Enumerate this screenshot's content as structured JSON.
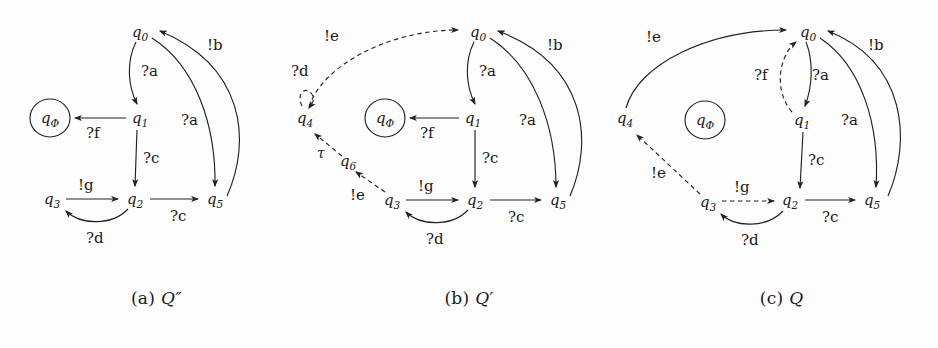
{
  "figure": {
    "background_color": "#fdfdfd",
    "stroke_color": "#222222",
    "text_color": "#1a1a1a"
  },
  "panels": [
    {
      "id": "a",
      "caption_index": "(a)",
      "caption_symbol": "Q″",
      "nodes": [
        {
          "name": "q0",
          "base": "q",
          "sub": "0",
          "x": 140,
          "y": 32,
          "accepting": false
        },
        {
          "name": "q1",
          "base": "q",
          "sub": "1",
          "x": 140,
          "y": 118,
          "accepting": false
        },
        {
          "name": "qPhi",
          "base": "q",
          "sub": "Φ",
          "x": 50,
          "y": 118,
          "accepting": true
        },
        {
          "name": "q2",
          "base": "q",
          "sub": "2",
          "x": 135,
          "y": 199,
          "accepting": false
        },
        {
          "name": "q3",
          "base": "q",
          "sub": "3",
          "x": 52,
          "y": 199,
          "accepting": false
        },
        {
          "name": "q5",
          "base": "q",
          "sub": "5",
          "x": 215,
          "y": 199,
          "accepting": false
        }
      ],
      "edges": [
        {
          "from": "q0",
          "to": "q1",
          "label": "?a",
          "style": "solid"
        },
        {
          "from": "q1",
          "to": "qPhi",
          "label": "?f",
          "style": "solid"
        },
        {
          "from": "q1",
          "to": "q2",
          "label": "?c",
          "style": "solid"
        },
        {
          "from": "q3",
          "to": "q2",
          "label": "!g",
          "style": "solid"
        },
        {
          "from": "q2",
          "to": "q3",
          "label": "?d",
          "style": "solid"
        },
        {
          "from": "q2",
          "to": "q5",
          "label": "?c",
          "style": "solid"
        },
        {
          "from": "q0",
          "to": "q5",
          "label": "?a",
          "style": "solid"
        },
        {
          "from": "q5",
          "to": "q0",
          "label": "!b",
          "style": "solid"
        }
      ]
    },
    {
      "id": "b",
      "caption_index": "(b)",
      "caption_symbol": "Q′",
      "nodes": [
        {
          "name": "q0",
          "base": "q",
          "sub": "0",
          "x": 478,
          "y": 32,
          "accepting": false
        },
        {
          "name": "q1",
          "base": "q",
          "sub": "1",
          "x": 473,
          "y": 118,
          "accepting": false
        },
        {
          "name": "qPhi",
          "base": "q",
          "sub": "Φ",
          "x": 385,
          "y": 118,
          "accepting": true
        },
        {
          "name": "q4",
          "base": "q",
          "sub": "4",
          "x": 305,
          "y": 118,
          "accepting": false
        },
        {
          "name": "q6",
          "base": "q",
          "sub": "6",
          "x": 348,
          "y": 161,
          "accepting": false
        },
        {
          "name": "q2",
          "base": "q",
          "sub": "2",
          "x": 475,
          "y": 200,
          "accepting": false
        },
        {
          "name": "q3",
          "base": "q",
          "sub": "3",
          "x": 392,
          "y": 200,
          "accepting": false
        },
        {
          "name": "q5",
          "base": "q",
          "sub": "5",
          "x": 558,
          "y": 200,
          "accepting": false
        }
      ],
      "edges": [
        {
          "from": "q0",
          "to": "q1",
          "label": "?a",
          "style": "solid"
        },
        {
          "from": "q1",
          "to": "qPhi",
          "label": "?f",
          "style": "solid"
        },
        {
          "from": "q1",
          "to": "q2",
          "label": "?c",
          "style": "solid"
        },
        {
          "from": "q3",
          "to": "q2",
          "label": "!g",
          "style": "solid"
        },
        {
          "from": "q2",
          "to": "q3",
          "label": "?d",
          "style": "solid"
        },
        {
          "from": "q2",
          "to": "q5",
          "label": "?c",
          "style": "solid"
        },
        {
          "from": "q0",
          "to": "q5",
          "label": "?a",
          "style": "solid"
        },
        {
          "from": "q5",
          "to": "q0",
          "label": "!b",
          "style": "solid"
        },
        {
          "from": "q4",
          "to": "q0",
          "label": "!e",
          "style": "dashed"
        },
        {
          "from": "q4",
          "to": "q4",
          "label": "?d",
          "style": "dashed"
        },
        {
          "from": "q6",
          "to": "q4",
          "label": "τ",
          "style": "dashed"
        },
        {
          "from": "q3",
          "to": "q6",
          "label": "!e",
          "style": "dashed"
        }
      ]
    },
    {
      "id": "c",
      "caption_index": "(c)",
      "caption_symbol": "Q",
      "nodes": [
        {
          "name": "q0",
          "base": "q",
          "sub": "0",
          "x": 808,
          "y": 32,
          "accepting": false
        },
        {
          "name": "q1",
          "base": "q",
          "sub": "1",
          "x": 802,
          "y": 120,
          "accepting": false
        },
        {
          "name": "qPhi",
          "base": "q",
          "sub": "Φ",
          "x": 705,
          "y": 120,
          "accepting": true
        },
        {
          "name": "q4",
          "base": "q",
          "sub": "4",
          "x": 625,
          "y": 118,
          "accepting": false
        },
        {
          "name": "q2",
          "base": "q",
          "sub": "2",
          "x": 790,
          "y": 200,
          "accepting": false
        },
        {
          "name": "q3",
          "base": "q",
          "sub": "3",
          "x": 708,
          "y": 202,
          "accepting": false
        },
        {
          "name": "q5",
          "base": "q",
          "sub": "5",
          "x": 872,
          "y": 200,
          "accepting": false
        }
      ],
      "edges": [
        {
          "from": "q0",
          "to": "q1",
          "label": "?a",
          "style": "solid"
        },
        {
          "from": "q1",
          "to": "q0",
          "label": "?f",
          "style": "dashed"
        },
        {
          "from": "q1",
          "to": "q2",
          "label": "?c",
          "style": "solid"
        },
        {
          "from": "q3",
          "to": "q2",
          "label": "!g",
          "style": "dashed"
        },
        {
          "from": "q2",
          "to": "q3",
          "label": "?d",
          "style": "solid"
        },
        {
          "from": "q2",
          "to": "q5",
          "label": "?c",
          "style": "solid"
        },
        {
          "from": "q0",
          "to": "q5",
          "label": "?a",
          "style": "solid"
        },
        {
          "from": "q5",
          "to": "q0",
          "label": "!b",
          "style": "solid"
        },
        {
          "from": "q4",
          "to": "q0",
          "label": "!e",
          "style": "solid"
        },
        {
          "from": "q3",
          "to": "q4",
          "label": "!e",
          "style": "dashed"
        }
      ]
    }
  ],
  "labels": {
    "a": {
      "n_q0": "q",
      "n_q0_sub": "0",
      "n_q1": "q",
      "n_q1_sub": "1",
      "n_qphi": "q",
      "n_qphi_sub": "Φ",
      "n_q2": "q",
      "n_q2_sub": "2",
      "n_q3": "q",
      "n_q3_sub": "3",
      "n_q5": "q",
      "n_q5_sub": "5",
      "e_a_top": "?a",
      "e_f": "?f",
      "e_c_mid": "?c",
      "e_g": "!g",
      "e_d": "?d",
      "e_c_bottom": "?c",
      "e_a_right": "?a",
      "e_b": "!b"
    },
    "b": {
      "n_q0": "q",
      "n_q0_sub": "0",
      "n_q1": "q",
      "n_q1_sub": "1",
      "n_qphi": "q",
      "n_qphi_sub": "Φ",
      "n_q4": "q",
      "n_q4_sub": "4",
      "n_q6": "q",
      "n_q6_sub": "6",
      "n_q2": "q",
      "n_q2_sub": "2",
      "n_q3": "q",
      "n_q3_sub": "3",
      "n_q5": "q",
      "n_q5_sub": "5",
      "e_a_top": "?a",
      "e_f": "?f",
      "e_c_mid": "?c",
      "e_g": "!g",
      "e_d_bottom": "?d",
      "e_c_bottom": "?c",
      "e_a_right": "?a",
      "e_b": "!b",
      "e_e_top": "!e",
      "e_d_loop": "?d",
      "e_tau": "τ",
      "e_e_low": "!e"
    },
    "c": {
      "n_q0": "q",
      "n_q0_sub": "0",
      "n_q1": "q",
      "n_q1_sub": "1",
      "n_qphi": "q",
      "n_qphi_sub": "Φ",
      "n_q4": "q",
      "n_q4_sub": "4",
      "n_q2": "q",
      "n_q2_sub": "2",
      "n_q3": "q",
      "n_q3_sub": "3",
      "n_q5": "q",
      "n_q5_sub": "5",
      "e_a_top": "?a",
      "e_f": "?f",
      "e_c_mid": "?c",
      "e_g": "!g",
      "e_d_bottom": "?d",
      "e_c_bottom": "?c",
      "e_a_right": "?a",
      "e_b": "!b",
      "e_e_top": "!e",
      "e_e_low": "!e"
    }
  },
  "captions": [
    {
      "index": "(a)",
      "symbol": "Q″"
    },
    {
      "index": "(b)",
      "symbol": "Q′"
    },
    {
      "index": "(c)",
      "symbol": "Q"
    }
  ]
}
